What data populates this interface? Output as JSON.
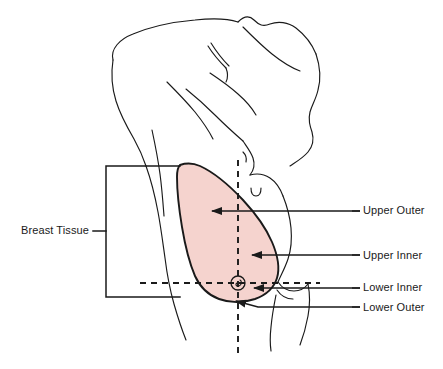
{
  "figure": {
    "background_color": "#ffffff",
    "outline_color": "#1a1a1a",
    "tissue_fill_color": "#f5d3ce",
    "tissue_stroke_color": "#1a1a1a",
    "text_color": "#1a1a1a"
  },
  "labels": {
    "breast_tissue": "Breast Tissue",
    "upper_outer": "Upper Outer",
    "upper_inner": "Upper Inner",
    "lower_inner": "Lower Inner",
    "lower_outer": "Lower Outer"
  },
  "annotations": {
    "bracket_label": "Breast Tissue",
    "quadrants": [
      {
        "name": "upper-outer",
        "label": "Upper Outer",
        "arrow_tip_x": 208,
        "arrow_tip_y": 211,
        "leader_y": 211
      },
      {
        "name": "upper-inner",
        "label": "Upper Inner",
        "arrow_tip_x": 248,
        "arrow_tip_y": 255,
        "leader_y": 255
      },
      {
        "name": "lower-inner",
        "label": "Lower Inner",
        "arrow_tip_x": 250,
        "arrow_tip_y": 288,
        "leader_y": 288
      },
      {
        "name": "lower-outer",
        "label": "Lower Outer",
        "arrow_tip_x": 232,
        "arrow_tip_y": 301,
        "leader_y": 307
      }
    ],
    "axis_lines": {
      "vertical_dashed": {
        "x": 238,
        "y_start": 160,
        "y_end": 356
      },
      "horizontal_dashed": {
        "y": 283,
        "x_start": 140,
        "x_end": 320
      }
    },
    "nipple": {
      "center_x": 238,
      "center_y": 283,
      "radius": 7
    }
  }
}
